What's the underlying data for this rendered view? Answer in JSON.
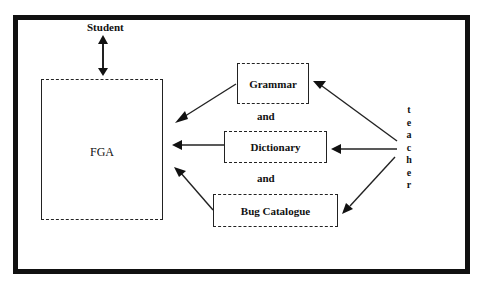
{
  "diagram": {
    "actor_top": "Student",
    "central_box": "FGA",
    "resources": [
      {
        "label": "Grammar"
      },
      {
        "label": "Dictionary"
      },
      {
        "label": "Bug Catalogue"
      }
    ],
    "connectors": [
      "and",
      "and"
    ],
    "actor_right": [
      "t",
      "e",
      "a",
      "c",
      "h",
      "e",
      "r"
    ]
  },
  "colors": {
    "line": "#222222",
    "frame": "#111111",
    "background": "#ffffff"
  }
}
